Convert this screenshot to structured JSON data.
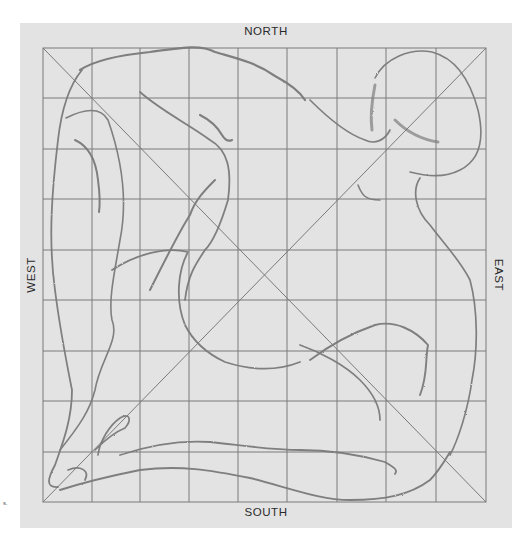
{
  "diagram": {
    "type": "grid-transfer-drawing",
    "grid": {
      "columns": 9,
      "rows": 9,
      "diagonals": 2
    },
    "labels": {
      "north": "NORTH",
      "south": "SOUTH",
      "west": "WEST",
      "east": "EAST"
    },
    "figure_mark": "s.",
    "colors": {
      "page_background": "#ffffff",
      "panel_background": "#e3e3e3",
      "grid_line": "#7a7a7a",
      "sketch_stroke": "#6e6e6e",
      "label_text": "#2a2a2a"
    }
  }
}
